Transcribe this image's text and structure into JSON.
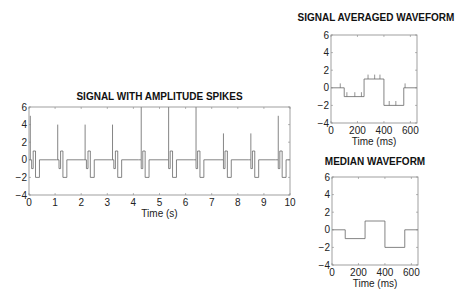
{
  "chart_data": [
    {
      "type": "line",
      "title": "SIGNAL WITH AMPLITUDE SPIKES",
      "xlabel": "Time (s)",
      "ylabel": "",
      "xlim": [
        0,
        10
      ],
      "ylim": [
        -4,
        6
      ],
      "xticks": [
        0,
        1,
        2,
        3,
        4,
        5,
        6,
        7,
        8,
        9,
        10
      ],
      "yticks": [
        -4,
        -2,
        0,
        2,
        4,
        6
      ],
      "waveform_period_s": 1.05,
      "waveform_ms": [
        [
          0,
          0
        ],
        [
          100,
          -1
        ],
        [
          160,
          1
        ],
        [
          250,
          -2
        ],
        [
          400,
          0
        ],
        [
          550,
          0
        ]
      ],
      "spikes": [
        {
          "t": 0.05,
          "amp": 5
        },
        {
          "t": 1.1,
          "amp": 4
        },
        {
          "t": 2.15,
          "amp": 4
        },
        {
          "t": 3.2,
          "amp": 4
        },
        {
          "t": 4.3,
          "amp": 7
        },
        {
          "t": 5.35,
          "amp": 7
        },
        {
          "t": 6.4,
          "amp": 7
        },
        {
          "t": 7.45,
          "amp": 3
        },
        {
          "t": 8.5,
          "amp": 3
        },
        {
          "t": 9.55,
          "amp": 5
        }
      ],
      "grid": false
    },
    {
      "type": "line",
      "title": "SIGNAL AVERAGED WAVEFORM",
      "xlabel": "Time (ms)",
      "xlim": [
        0,
        650
      ],
      "ylim": [
        -4,
        6
      ],
      "xticks": [
        0,
        200,
        400,
        600
      ],
      "yticks": [
        -4,
        -2,
        0,
        2,
        4,
        6
      ],
      "x": [
        0,
        100,
        100,
        250,
        250,
        400,
        400,
        550,
        550,
        650
      ],
      "y": [
        0,
        0,
        -1,
        -1,
        1,
        1,
        -2,
        -2,
        0,
        0
      ],
      "small_spikes_ms": [
        70,
        120,
        180,
        230,
        280,
        330,
        370,
        440,
        490,
        560
      ],
      "grid": false
    },
    {
      "type": "line",
      "title": "MEDIAN WAVEFORM",
      "xlabel": "Time (ms)",
      "xlim": [
        0,
        650
      ],
      "ylim": [
        -4,
        6
      ],
      "xticks": [
        0,
        200,
        400,
        600
      ],
      "yticks": [
        -4,
        -2,
        0,
        2,
        4,
        6
      ],
      "x": [
        0,
        100,
        100,
        250,
        250,
        400,
        400,
        550,
        550,
        650
      ],
      "y": [
        0,
        0,
        -1,
        -1,
        1,
        1,
        -2,
        -2,
        0,
        0
      ],
      "grid": false
    }
  ],
  "titles": {
    "main": "SIGNAL WITH AMPLITUDE SPIKES",
    "avg": "SIGNAL AVERAGED WAVEFORM",
    "median": "MEDIAN WAVEFORM"
  },
  "xlabels": {
    "main": "Time (s)",
    "avg": "Time (ms)",
    "median": "Time (ms)"
  }
}
